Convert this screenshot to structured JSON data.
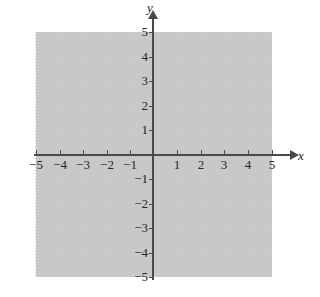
{
  "figure": {
    "kind": "cartesian-coordinate-grid",
    "axis_labels": {
      "x": "x",
      "y": "y"
    },
    "colors": {
      "background": "#ffffff",
      "grid": "#cccccc",
      "axis": "#4a4a4a",
      "text": "#262626"
    }
  },
  "chart_data": {
    "type": "scatter",
    "title": "",
    "xlabel": "x",
    "ylabel": "y",
    "xlim": [
      -5,
      5
    ],
    "ylim": [
      -5,
      5
    ],
    "xticks": [
      -5,
      -4,
      -3,
      -2,
      -1,
      1,
      2,
      3,
      4,
      5
    ],
    "yticks": [
      -5,
      -4,
      -3,
      -2,
      -1,
      1,
      2,
      3,
      4,
      5
    ],
    "xtick_labels": [
      "−5",
      "−4",
      "−3",
      "−2",
      "−1",
      "1",
      "2",
      "3",
      "4",
      "5"
    ],
    "ytick_labels": [
      "−5",
      "−4",
      "−3",
      "−2",
      "−1",
      "1",
      "2",
      "3",
      "4",
      "5"
    ],
    "x": [],
    "y": [],
    "series": [],
    "grid": true,
    "grid_style": "dotted",
    "legend": null,
    "annotations": [],
    "axis_arrows": {
      "x_positive": true,
      "y_positive": true
    }
  },
  "x_labels": [
    {
      "value": -5,
      "text": "−5",
      "px": 36
    },
    {
      "value": -4,
      "text": "−4",
      "px": 60
    },
    {
      "value": -3,
      "text": "−3",
      "px": 83
    },
    {
      "value": -2,
      "text": "−2",
      "px": 107
    },
    {
      "value": -1,
      "text": "−1",
      "px": 130
    },
    {
      "value": 1,
      "text": "1",
      "px": 177
    },
    {
      "value": 2,
      "text": "2",
      "px": 201
    },
    {
      "value": 3,
      "text": "3",
      "px": 224
    },
    {
      "value": 4,
      "text": "4",
      "px": 248
    },
    {
      "value": 5,
      "text": "5",
      "px": 272
    }
  ],
  "y_labels": [
    {
      "value": 5,
      "text": "5",
      "px": 32
    },
    {
      "value": 4,
      "text": "4",
      "px": 57
    },
    {
      "value": 3,
      "text": "3",
      "px": 81
    },
    {
      "value": 2,
      "text": "2",
      "px": 106
    },
    {
      "value": 1,
      "text": "1",
      "px": 130
    },
    {
      "value": -1,
      "text": "−1",
      "px": 179
    },
    {
      "value": -2,
      "text": "−2",
      "px": 204
    },
    {
      "value": -3,
      "text": "−3",
      "px": 228
    },
    {
      "value": -4,
      "text": "−4",
      "px": 253
    },
    {
      "value": -5,
      "text": "−5",
      "px": 277
    }
  ]
}
